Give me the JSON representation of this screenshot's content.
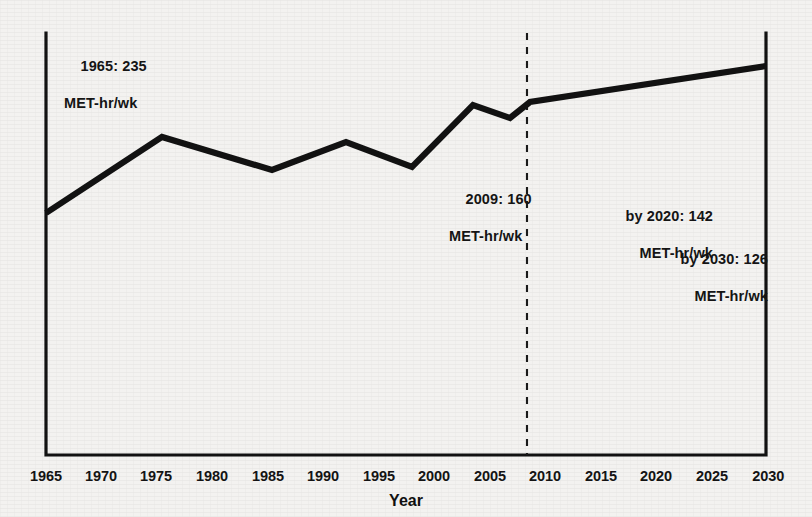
{
  "figure": {
    "background_color": "#f3f2f0",
    "ink_color": "#121212"
  },
  "axis": {
    "x_title": "Year",
    "tick_labels": [
      "1965",
      "1970",
      "1975",
      "1980",
      "1985",
      "1990",
      "1995",
      "2000",
      "2005",
      "2010",
      "2015",
      "2020",
      "2025",
      "2030"
    ]
  },
  "annotations": {
    "a1965": {
      "line1": "1965: 235",
      "line2": "MET-hr/wk"
    },
    "a2009": {
      "line1": "2009: 160",
      "line2": "MET-hr/wk"
    },
    "a2020": {
      "line1": "by 2020: 142",
      "line2": "MET-hr/wk"
    },
    "a2030": {
      "line1": "by 2030: 126",
      "line2": "MET-hr/wk"
    }
  },
  "chart_data": {
    "type": "line",
    "title": "",
    "subtitle": "",
    "xlabel": "Year",
    "ylabel": "",
    "xlim": [
      1965,
      2030
    ],
    "ylim": [
      120,
      245
    ],
    "grid": false,
    "legend": false,
    "note": "Y axis is unlabeled; the vertical direction is inverted relative to the stated MET-hr/wk values — the drawn curve rises as the reported MET-hr/wk values fall. Values below are the MET-hr/wk figures implied by the four printed annotations and the drawn vertex positions.",
    "series": [
      {
        "name": "Estimated weekly physical activity (MET-hr/wk)",
        "style": "solid",
        "color": "#121212",
        "x": [
          1965,
          1975,
          1985,
          1992,
          1998,
          2003,
          2007,
          2009,
          2020,
          2030
        ],
        "values": [
          235,
          206,
          215,
          208,
          214,
          193,
          198,
          190,
          142,
          126
        ],
        "projected_from": 2009
      }
    ],
    "reference_lines": [
      {
        "name": "2009 observed/projected divider",
        "orientation": "vertical",
        "x": 2009,
        "style": "dashed",
        "color": "#1a1a1a"
      }
    ],
    "annotations": [
      {
        "x": 1965,
        "label": "1965: 235 MET-hr/wk",
        "value": 235
      },
      {
        "x": 2009,
        "label": "2009: 160 MET-hr/wk",
        "value": 160
      },
      {
        "x": 2020,
        "label": "by 2020: 142 MET-hr/wk",
        "value": 142
      },
      {
        "x": 2030,
        "label": "by 2030: 126 MET-hr/wk",
        "value": 126
      }
    ]
  },
  "geometry": {
    "plot_left": 46,
    "plot_right": 766,
    "plot_bottom": 455,
    "plot_top": 33,
    "dashed_x": 527,
    "curve_points": "46,213 162,137 272,170 346,142 412,167 473,105 510,118 530,102 766,66",
    "tick_x": [
      46,
      101,
      156,
      212,
      268,
      323,
      379,
      434,
      490,
      545,
      601,
      656,
      712,
      767
    ]
  }
}
